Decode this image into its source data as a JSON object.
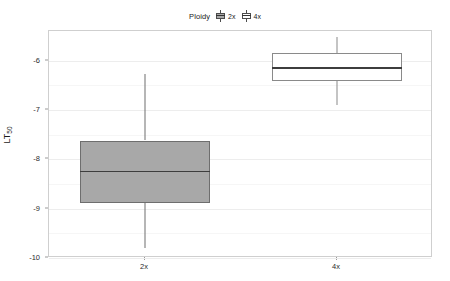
{
  "legend": {
    "title": "Ploidy",
    "entries": [
      {
        "label": "2x",
        "fill": "#a8a8a8",
        "stroke": "#4d4d4d"
      },
      {
        "label": "4x",
        "fill": "#ffffff",
        "stroke": "#4d4d4d"
      }
    ]
  },
  "axes": {
    "y_title_main": "LT",
    "y_title_sub": "50",
    "y_ticks": [
      "-6",
      "-7",
      "-8",
      "-9",
      "-10"
    ],
    "x_ticks": [
      "2x",
      "4x"
    ]
  },
  "chart_data": {
    "type": "box",
    "title": "",
    "subtitle": "",
    "xlabel": "",
    "ylabel": "LT50",
    "categories": [
      "2x",
      "4x"
    ],
    "ylim": [
      -10,
      -5.4
    ],
    "yticks": [
      -6,
      -7,
      -8,
      -9,
      -10
    ],
    "grid": true,
    "legend_title": "Ploidy",
    "legend_position": "top",
    "boxes": [
      {
        "name": "2x",
        "category": "2x",
        "whisker_low": -9.79,
        "q1": -8.88,
        "median": -8.25,
        "q3": -7.62,
        "whisker_high": -6.27,
        "fill": "#a8a8a8",
        "stroke": "#6e6e6e",
        "outliers": []
      },
      {
        "name": "4x",
        "category": "4x",
        "whisker_low": -6.9,
        "q1": -6.42,
        "median": -6.15,
        "q3": -5.85,
        "whisker_high": -5.52,
        "fill": "#ffffff",
        "stroke": "#8a8a8a",
        "outliers": []
      }
    ]
  }
}
